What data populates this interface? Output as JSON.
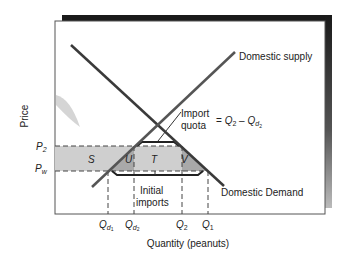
{
  "diagram": {
    "axes": {
      "y_label": "Price",
      "x_label": "Quantity (peanuts)"
    },
    "price_ticks": [
      {
        "main": "P",
        "sub": "2",
        "y": 146
      },
      {
        "main": "P",
        "sub": "w",
        "y": 171
      }
    ],
    "quantity_ticks": [
      {
        "main": "Q",
        "sub": "d",
        "subsub": "1",
        "x": 108
      },
      {
        "main": "Q",
        "sub": "d",
        "subsub": "2",
        "x": 134
      },
      {
        "main": "Q",
        "sub": "2",
        "x": 182
      },
      {
        "main": "Q",
        "sub": "1",
        "x": 208
      }
    ],
    "curves": {
      "supply_label": "Domestic supply",
      "demand_label": "Domestic Demand"
    },
    "areas": {
      "s": "S",
      "u": "U",
      "t": "T",
      "v": "V"
    },
    "annotations": {
      "import_line1": "Import",
      "import_line2": "quota",
      "equation_prefix": "= ",
      "equation_q2": "Q",
      "equation_q2_sub": "2",
      "equation_minus": " – ",
      "equation_qd": "Q",
      "equation_qd_sub": "d",
      "equation_qd_subsub": "2",
      "initial_line1": "Initial",
      "initial_line2": "imports"
    },
    "colors": {
      "frame_shadow": "#1a1a1a",
      "band_light": "#cfcfcf",
      "band_dark": "#a9a9a9",
      "curve": "#3a3a3a"
    }
  }
}
